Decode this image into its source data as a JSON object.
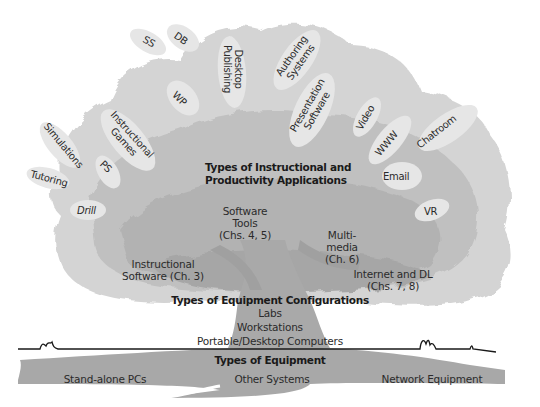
{
  "diagram": {
    "type": "tree-metaphor",
    "crown": {
      "heading": [
        "Types of Instructional and",
        "Productivity Applications"
      ],
      "leaves": [
        {
          "id": "ss",
          "label": "SS"
        },
        {
          "id": "db",
          "label": "DB"
        },
        {
          "id": "desktop-publishing",
          "label": [
            "Desktop",
            "Publishing"
          ]
        },
        {
          "id": "authoring-systems",
          "label": [
            "Authoring",
            "Systems"
          ]
        },
        {
          "id": "wp",
          "label": "WP"
        },
        {
          "id": "presentation-software",
          "label": [
            "Presentation",
            "Software"
          ]
        },
        {
          "id": "video",
          "label": "Video"
        },
        {
          "id": "www",
          "label": "WWW"
        },
        {
          "id": "chatroom",
          "label": "Chatroom"
        },
        {
          "id": "email",
          "label": "Email"
        },
        {
          "id": "vr",
          "label": "VR"
        },
        {
          "id": "simulations",
          "label": "Simulations"
        },
        {
          "id": "instructional-games",
          "label": [
            "Instructional",
            "Games"
          ]
        },
        {
          "id": "ps",
          "label": "PS"
        },
        {
          "id": "tutoring",
          "label": "Tutoring"
        },
        {
          "id": "drill",
          "label": "Drill"
        }
      ],
      "branches": [
        {
          "id": "software-tools",
          "label": [
            "Software",
            "Tools",
            "(Chs. 4, 5)"
          ]
        },
        {
          "id": "instructional-software",
          "label": [
            "Instructional",
            "Software (Ch. 3)"
          ]
        },
        {
          "id": "multimedia",
          "label": [
            "Multi-",
            "media",
            "(Ch. 6)"
          ]
        },
        {
          "id": "internet-dl",
          "label": [
            "Internet and DL",
            "(Chs. 7, 8)"
          ]
        }
      ]
    },
    "trunk": {
      "heading": "Types of Equipment Configurations",
      "items": [
        "Labs",
        "Workstations",
        "Portable/Desktop Computers"
      ]
    },
    "roots": {
      "heading": "Types of Equipment",
      "items": [
        "Stand-alone PCs",
        "Other Systems",
        "Network Equipment"
      ]
    },
    "colors": {
      "foliage_light": "#d9d9d9",
      "foliage_mid": "#c2c2c2",
      "foliage_dark": "#a9a9a9",
      "leaf_fill": "#e4e4e4",
      "trunk": "#a8a8a8",
      "ground_line": "#1a1a1a",
      "text": "#2b2b2b"
    }
  }
}
